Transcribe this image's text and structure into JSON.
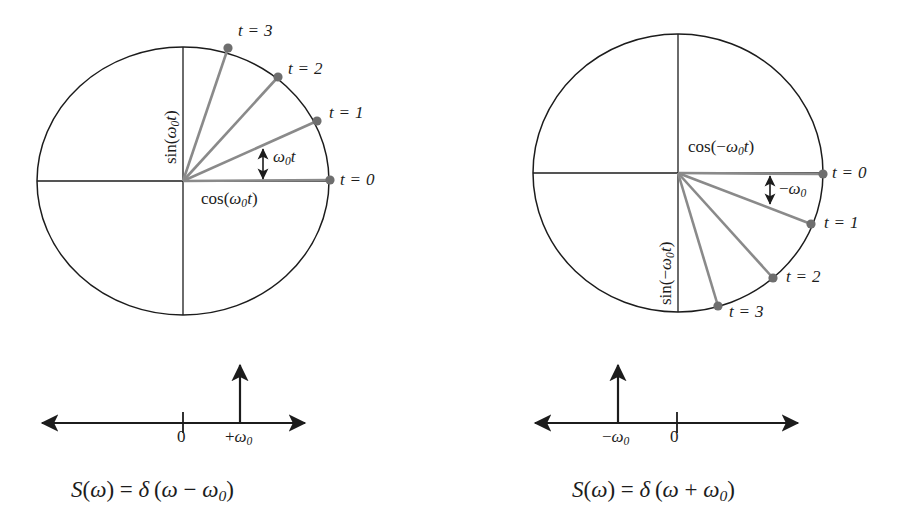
{
  "figure": {
    "background_color": "#ffffff",
    "ink_color": "#1c1c1c",
    "phasor_color": "#808080",
    "dot_color": "#6e6e6e"
  },
  "left_panel": {
    "name": "positive-frequency-phasor",
    "circle": {
      "cx": 183,
      "cy": 181,
      "rx": 146,
      "ry": 134
    },
    "axis_labels": {
      "horizontal": "cos(ω₀t)",
      "horizontal_parts": {
        "fn": "cos",
        "open": "(",
        "sym": "ω",
        "sub": "0",
        "var": "t",
        "close": ")"
      },
      "vertical": "sin(ω₀t)",
      "vertical_parts": {
        "fn": "sin",
        "open": "(",
        "sym": "ω",
        "sub": "0",
        "var": "t",
        "close": ")"
      }
    },
    "angle_annotation": {
      "label": "ω₀t",
      "sym": "ω",
      "sub": "0",
      "var": "t"
    },
    "rotation_direction": "counter-clockwise",
    "samples": [
      {
        "label": "t = 0",
        "t": 0,
        "angle_deg": 0,
        "x": 330,
        "y": 180
      },
      {
        "label": "t = 1",
        "t": 1,
        "angle_deg": 24,
        "x": 317,
        "y": 121
      },
      {
        "label": "t = 2",
        "t": 2,
        "angle_deg": 48,
        "x": 278,
        "y": 77
      },
      {
        "label": "t = 3",
        "t": 3,
        "angle_deg": 72,
        "x": 228,
        "y": 48
      }
    ],
    "spectrum": {
      "name": "positive-frequency-spectrum",
      "axis_y": 423,
      "x_start": 42,
      "x_end": 305,
      "zero_tick": {
        "label": "0",
        "x": 183
      },
      "impulse": {
        "label": "+ω₀",
        "sym": "ω",
        "sub": "0",
        "sign": "+",
        "x": 240,
        "top_y": 365
      },
      "equation": "S(ω) = δ(ω − ω₀)",
      "equation_parts": {
        "S": "S",
        "open1": "(",
        "w1": "ω",
        "close1": ")",
        "eq": "=",
        "delta": "δ",
        "open2": "(",
        "w2": "ω",
        "op": "−",
        "w3": "ω",
        "sub3": "0",
        "close2": ")"
      }
    }
  },
  "right_panel": {
    "name": "negative-frequency-phasor",
    "circle": {
      "cx": 678,
      "cy": 173,
      "rx": 145,
      "ry": 139
    },
    "axis_labels": {
      "horizontal": "cos(−ω₀t)",
      "horizontal_parts": {
        "fn": "cos",
        "open": "(",
        "sign": "−",
        "sym": "ω",
        "sub": "0",
        "var": "t",
        "close": ")"
      },
      "vertical": "sin(−ω₀t)",
      "vertical_parts": {
        "fn": "sin",
        "open": "(",
        "sign": "−",
        "sym": "ω",
        "sub": "0",
        "var": "t",
        "close": ")"
      }
    },
    "angle_annotation": {
      "label": "−ω₀",
      "sign": "−",
      "sym": "ω",
      "sub": "0"
    },
    "rotation_direction": "clockwise",
    "samples": [
      {
        "label": "t = 0",
        "t": 0,
        "angle_deg": 0,
        "x": 823,
        "y": 174
      },
      {
        "label": "t = 1",
        "t": 1,
        "angle_deg": -21,
        "x": 811,
        "y": 224
      },
      {
        "label": "t = 2",
        "t": 2,
        "angle_deg": -48,
        "x": 773,
        "y": 278
      },
      {
        "label": "t = 3",
        "t": 3,
        "angle_deg": -73,
        "x": 718,
        "y": 306
      }
    ],
    "spectrum": {
      "name": "negative-frequency-spectrum",
      "axis_y": 423,
      "x_start": 535,
      "x_end": 798,
      "zero_tick": {
        "label": "0",
        "x": 677
      },
      "impulse": {
        "label": "−ω₀",
        "sym": "ω",
        "sub": "0",
        "sign": "−",
        "x": 618,
        "top_y": 365
      },
      "equation": "S(ω) = δ(ω + ω₀)",
      "equation_parts": {
        "S": "S",
        "open1": "(",
        "w1": "ω",
        "close1": ")",
        "eq": "=",
        "delta": "δ",
        "open2": "(",
        "w2": "ω",
        "op": "+",
        "w3": "ω",
        "sub3": "0",
        "close2": ")"
      }
    }
  }
}
